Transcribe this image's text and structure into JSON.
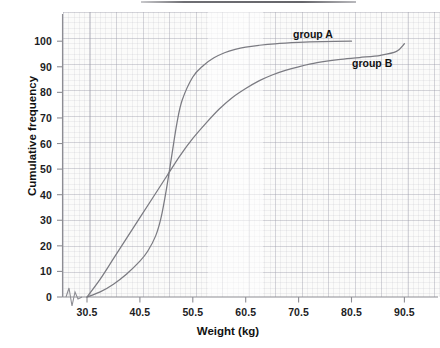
{
  "chart_data": {
    "type": "line",
    "title": "",
    "xlabel": "Weight (kg)",
    "ylabel": "Cumulative frequency",
    "xlim": [
      25.5,
      92.5
    ],
    "ylim": [
      0,
      105
    ],
    "xticks": [
      "30.5",
      "40.5",
      "50.5",
      "60.5",
      "70.5",
      "80.5",
      "90.5"
    ],
    "xtick_values": [
      30.5,
      40.5,
      50.5,
      60.5,
      70.5,
      80.5,
      90.5
    ],
    "yticks": [
      "0",
      "10",
      "20",
      "30",
      "40",
      "50",
      "60",
      "70",
      "80",
      "90",
      "100"
    ],
    "ytick_values": [
      0,
      10,
      20,
      30,
      40,
      50,
      60,
      70,
      80,
      90,
      100
    ],
    "grid": true,
    "legend_position": "inline-at-curve-end",
    "axis_break_marker": true,
    "line_color": "#7b7b82",
    "background_color": "#fbfbfa",
    "series": [
      {
        "name": "group A",
        "label": "group A",
        "x": [
          30.5,
          33,
          35.5,
          38,
          40.5,
          42,
          43.5,
          44.5,
          45.5,
          46.5,
          47.5,
          48.5,
          50.5,
          52.5,
          54.5,
          56.5,
          58.5,
          60.5,
          63,
          66,
          70.5,
          75,
          80.5
        ],
        "values": [
          0,
          2,
          5,
          9,
          14,
          18,
          24,
          31,
          42,
          55,
          68,
          77,
          86,
          90.5,
          93.5,
          95.5,
          96.8,
          97.7,
          98.4,
          99,
          99.5,
          99.8,
          100
        ]
      },
      {
        "name": "group B",
        "label": "group B",
        "x": [
          30.5,
          33,
          35.5,
          38,
          40.5,
          43,
          45.5,
          48,
          50.5,
          53,
          55.5,
          58,
          60.5,
          63,
          65.5,
          68,
          70.5,
          74,
          78,
          82,
          86,
          89,
          90.5
        ],
        "values": [
          0,
          7,
          15,
          23,
          31,
          39,
          47,
          55,
          62,
          68,
          73.5,
          78,
          81.5,
          84.5,
          86.8,
          88.6,
          90,
          91.6,
          92.8,
          93.6,
          94.5,
          96,
          99
        ]
      }
    ]
  },
  "labels": {
    "y_axis_title": "Cumulative frequency",
    "x_axis_title": "Weight (kg)",
    "group_a": "group A",
    "group_b": "group B"
  }
}
